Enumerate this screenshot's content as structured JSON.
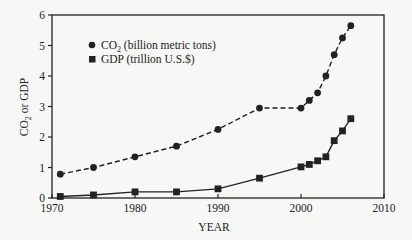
{
  "chart_data": {
    "type": "line",
    "title": "",
    "xlabel": "YEAR",
    "ylabel": "CO2 or GDP",
    "xlim": [
      1970,
      2010
    ],
    "ylim": [
      0,
      6
    ],
    "xticks": [
      1970,
      1980,
      1990,
      2000,
      2010
    ],
    "yticks": [
      0,
      1,
      2,
      3,
      4,
      5,
      6
    ],
    "grid": false,
    "legend_position": "upper-left",
    "series": [
      {
        "name": "CO2 (billion metric tons)",
        "marker": "circle",
        "line": "dashed",
        "x": [
          1971,
          1975,
          1980,
          1985,
          1990,
          1995,
          2000,
          2001,
          2002,
          2003,
          2004,
          2005,
          2006
        ],
        "values": [
          0.78,
          1.0,
          1.35,
          1.7,
          2.25,
          2.95,
          2.95,
          3.2,
          3.45,
          4.0,
          4.7,
          5.25,
          5.65
        ]
      },
      {
        "name": "GDP (trillion U.S.$)",
        "marker": "square",
        "line": "solid",
        "x": [
          1971,
          1975,
          1980,
          1985,
          1990,
          1995,
          2000,
          2001,
          2002,
          2003,
          2004,
          2005,
          2006
        ],
        "values": [
          0.05,
          0.1,
          0.2,
          0.2,
          0.3,
          0.65,
          1.02,
          1.1,
          1.22,
          1.35,
          1.88,
          2.2,
          2.6
        ]
      }
    ]
  },
  "legend": {
    "co2_prefix": "CO",
    "co2_sub": "2",
    "co2_suffix": " (billion metric tons)",
    "gdp": "GDP (trillion U.S.$)"
  },
  "axes": {
    "xlabel": "YEAR",
    "ylabel_prefix": "CO",
    "ylabel_sub": "2",
    "ylabel_suffix": " or GDP"
  },
  "colors": {
    "ink": "#222222",
    "background": "#f7f7f5"
  }
}
